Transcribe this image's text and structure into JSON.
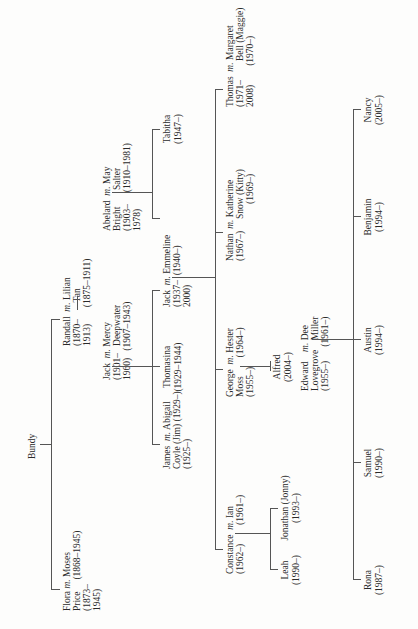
{
  "title": "Bundy",
  "marriage_symbol": "m.",
  "gen1": {
    "flora": {
      "name1": "Flora",
      "name2": "Price",
      "dates1": "(1873–",
      "dates2": "1945)"
    },
    "flora_spouse": {
      "name1": "Moses",
      "dates1": "(1868–1945)"
    },
    "randall": {
      "name1": "Randall",
      "dates1": "(1870–",
      "dates2": "1913)"
    },
    "randall_spouse": {
      "name1": "Lilian",
      "name2": "Tan",
      "dates1": "(1875–1911)"
    }
  },
  "gen2": {
    "jack": {
      "name1": "Jack",
      "dates1": "(1901–",
      "dates2": "1960)"
    },
    "jack_spouse": {
      "name1": "Mercy",
      "name2": "Deepwater",
      "dates1": "(1907–1943)"
    },
    "abelard": {
      "name1": "Abelard",
      "name2": "Bright",
      "dates1": "(1903–",
      "dates2": "1978)"
    },
    "abelard_spouse": {
      "name1": "May",
      "name2": "Salter",
      "dates1": "(1910–1981)"
    }
  },
  "gen3": {
    "james": {
      "name1": "James",
      "name2": "Coyle (Jim)",
      "dates1": "(1925–)"
    },
    "james_spouse": {
      "name1": "Abigail",
      "dates1": "(1929–)"
    },
    "thomasina": {
      "name1": "Thomasina",
      "dates1": "(1929–1944)"
    },
    "jack": {
      "name1": "Jack",
      "dates1": "(1937–",
      "dates2": "2000)"
    },
    "jack_spouse": {
      "name1": "Emmeline",
      "dates1": "(1940–)"
    },
    "tabitha": {
      "name1": "Tabitha",
      "dates1": "(1947–)"
    }
  },
  "gen4": {
    "constance": {
      "name1": "Constance",
      "dates1": "(1962–)"
    },
    "constance_spouse": {
      "name1": "Ian",
      "dates1": "(1961–)"
    },
    "george": {
      "name1": "George",
      "name2": "Moss",
      "dates1": "(1955–)"
    },
    "george_spouse": {
      "name1": "Hester",
      "dates1": "(1964–)"
    },
    "nathan": {
      "name1": "Nathan",
      "dates1": "(1967–)"
    },
    "nathan_spouse": {
      "name1": "Katherine",
      "name2": "Snow (Kitty)",
      "dates1": "(1969–)"
    },
    "thomas": {
      "name1": "Thomas",
      "dates1": "(1971–",
      "dates2": "2008)"
    },
    "thomas_spouse": {
      "name1": "Margaret",
      "name2": "Bell (Maggie)",
      "dates1": "(1970–)"
    },
    "edward": {
      "name1": "Edward",
      "name2": "Lovegrove",
      "dates1": "(1955–)"
    },
    "edward_spouse": {
      "name1": "Dee",
      "name2": "Miller",
      "dates1": "(1961–)"
    }
  },
  "gen5": {
    "leah": {
      "name1": "Leah",
      "dates1": "(1990–)"
    },
    "jonathan": {
      "name1": "Jonathan (Jonny)",
      "dates1": "(1993–)"
    },
    "alfred": {
      "name1": "Alfred",
      "dates1": "(2004–)"
    },
    "rona": {
      "name1": "Rona",
      "dates1": "(1987–)"
    },
    "samuel": {
      "name1": "Samuel",
      "dates1": "(1990–)"
    },
    "austin": {
      "name1": "Austin",
      "dates1": "(1994–)"
    },
    "benjamin": {
      "name1": "Benjamin",
      "dates1": "(1994–)"
    },
    "nancy": {
      "name1": "Nancy",
      "dates1": "(2005–)"
    }
  }
}
